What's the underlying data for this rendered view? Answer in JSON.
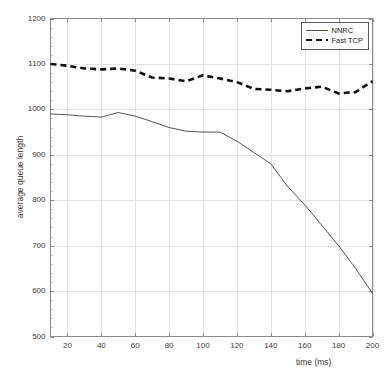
{
  "chart_data": {
    "type": "line",
    "title": "",
    "xlabel": "time (ms)",
    "ylabel": "average queue length",
    "xlim": [
      10,
      200
    ],
    "ylim": [
      500,
      1200
    ],
    "xticks": [
      20,
      40,
      60,
      80,
      100,
      120,
      140,
      160,
      180,
      200
    ],
    "yticks": [
      500,
      600,
      700,
      800,
      900,
      1000,
      1100,
      1200
    ],
    "grid": true,
    "legend_position": "top-right",
    "x": [
      10,
      20,
      30,
      40,
      50,
      60,
      70,
      80,
      90,
      100,
      110,
      120,
      130,
      140,
      150,
      160,
      170,
      180,
      190,
      200
    ],
    "series": [
      {
        "name": "NNRC",
        "style": "solid",
        "color": "#555555",
        "values": [
          990,
          988,
          985,
          983,
          993,
          985,
          973,
          960,
          952,
          950,
          950,
          930,
          905,
          880,
          830,
          790,
          745,
          700,
          650,
          595
        ]
      },
      {
        "name": "Fast TCP",
        "style": "dashed",
        "color": "#111111",
        "values": [
          1100,
          1096,
          1090,
          1088,
          1090,
          1085,
          1070,
          1068,
          1062,
          1075,
          1068,
          1060,
          1045,
          1043,
          1040,
          1046,
          1050,
          1035,
          1038,
          1062
        ]
      }
    ]
  },
  "legend": {
    "entries": [
      {
        "label": "NNRC"
      },
      {
        "label": "Fast TCP"
      }
    ]
  },
  "axes": {
    "xlabel": "time (ms)",
    "ylabel": "average queue length"
  }
}
